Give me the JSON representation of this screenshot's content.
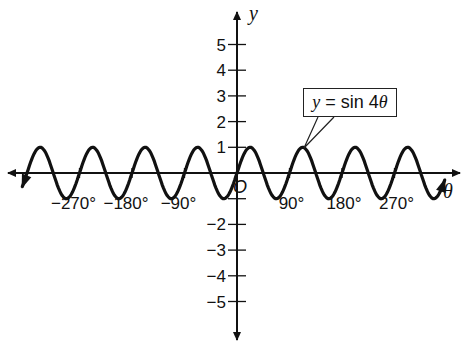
{
  "chart_data": {
    "type": "line",
    "title": "",
    "xlabel": "θ",
    "ylabel": "y",
    "function": "y = sin 4θ",
    "annotation": "y = sin 4θ",
    "x_unit": "degrees",
    "xlim": [
      -405,
      390
    ],
    "ylim": [
      -5.5,
      5.5
    ],
    "x_ticks": [
      -270,
      -180,
      -90,
      90,
      180,
      270
    ],
    "x_tick_labels": [
      "−270°",
      "−180°",
      "−90°",
      "90°",
      "180°",
      "270°"
    ],
    "y_ticks": [
      -5,
      -4,
      -3,
      -2,
      -1,
      1,
      2,
      3,
      4,
      5
    ],
    "y_tick_labels": [
      "−5",
      "−4",
      "−3",
      "−2",
      "",
      "1",
      "2",
      "3",
      "4",
      "5"
    ],
    "origin_label": "O",
    "grid": false,
    "amplitude": 1,
    "period_degrees": 90,
    "series": [
      {
        "name": "y = sin 4θ",
        "x": [
          -360,
          -337.5,
          -315,
          -292.5,
          -270,
          -247.5,
          -225,
          -202.5,
          -180,
          -157.5,
          -135,
          -112.5,
          -90,
          -67.5,
          -45,
          -22.5,
          0,
          22.5,
          45,
          67.5,
          90,
          112.5,
          135,
          157.5,
          180,
          202.5,
          225,
          247.5,
          270,
          292.5,
          315,
          337.5,
          360
        ],
        "values": [
          0,
          1,
          0,
          -1,
          0,
          1,
          0,
          -1,
          0,
          1,
          0,
          -1,
          0,
          1,
          0,
          -1,
          0,
          1,
          0,
          -1,
          0,
          1,
          0,
          -1,
          0,
          1,
          0,
          -1,
          0,
          1,
          0,
          -1,
          0
        ]
      }
    ]
  },
  "labels": {
    "y_axis": "y",
    "x_axis": "θ",
    "origin": "O",
    "callout_prefix": "y",
    "callout_middle": " = sin 4",
    "callout_suffix": "θ",
    "x_ticks": [
      "−270°",
      "−180°",
      "−90°",
      "90°",
      "180°",
      "270°"
    ],
    "y_pos": [
      "1",
      "2",
      "3",
      "4",
      "5"
    ],
    "y_neg": [
      "−2",
      "−3",
      "−4",
      "−5"
    ]
  }
}
